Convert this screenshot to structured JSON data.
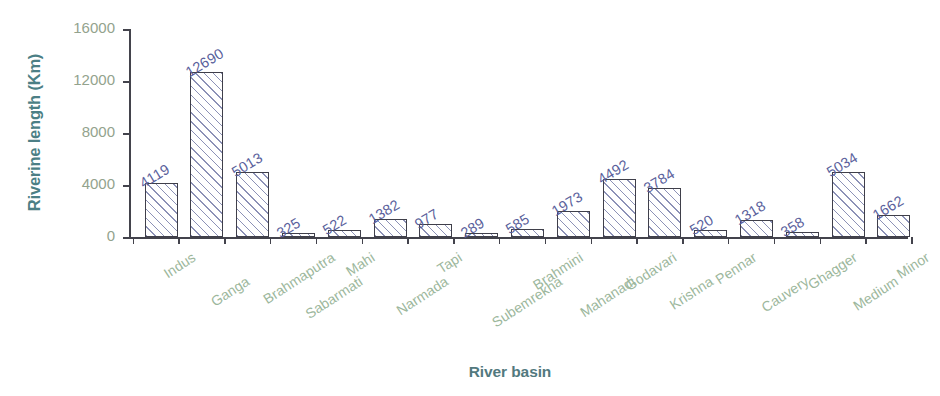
{
  "chart_data": {
    "type": "bar",
    "title": "",
    "xlabel": "River basin",
    "ylabel": "Riverine length (Km)",
    "ylim": [
      0,
      16000
    ],
    "yticks": [
      0,
      4000,
      8000,
      12000,
      16000
    ],
    "ytick_labels": [
      "0",
      "4000",
      "8000",
      "12000",
      "16000"
    ],
    "grid": false,
    "legend": "none",
    "categories": [
      "Indus",
      "Ganga",
      "Brahmaputra",
      "Sabarmati",
      "Mahi",
      "Narmada",
      "Tapi",
      "Subemrekha",
      "Brahmini",
      "Mahanadi",
      "Godavari",
      "Krishna",
      "Pennar",
      "Cauvery",
      "Ghagger",
      "Medium",
      "Minor"
    ],
    "values": [
      4119,
      12690,
      5013,
      325,
      522,
      1382,
      977,
      289,
      585,
      1973,
      4492,
      3784,
      520,
      1318,
      358,
      5034,
      1662
    ],
    "value_labels": [
      "4119",
      "12690",
      "5013",
      "325",
      "522",
      "1382",
      "977",
      "289",
      "585",
      "1973",
      "4492",
      "3784",
      "520",
      "1318",
      "358",
      "5034",
      "1662"
    ]
  },
  "colors": {
    "axis_title": "#4c7f85",
    "ytick_label": "#93a38d",
    "category_label": "#9cb79c",
    "value_label": "#5a5f9c",
    "bar_outline": "#3f3f4a",
    "bar_hatch": "#787eaa",
    "background": "#ffffff"
  }
}
